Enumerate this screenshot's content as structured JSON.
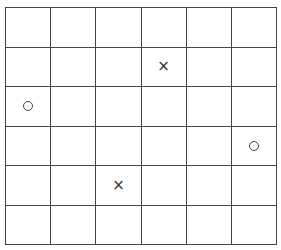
{
  "board": {
    "rows": 6,
    "cols": 6,
    "line_color": "#444444",
    "background": "#ffffff",
    "cells": [
      [
        "",
        "",
        "",
        "",
        "",
        ""
      ],
      [
        "",
        "",
        "",
        "X",
        "",
        ""
      ],
      [
        "O",
        "",
        "",
        "",
        "",
        ""
      ],
      [
        "",
        "",
        "",
        "",
        "",
        "O"
      ],
      [
        "",
        "",
        "X",
        "",
        "",
        ""
      ],
      [
        "",
        "",
        "",
        "",
        "",
        ""
      ]
    ],
    "symbols": {
      "X": "×"
    }
  }
}
